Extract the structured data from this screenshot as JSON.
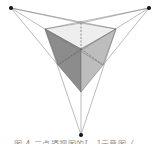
{
  "diagram": {
    "vanishing_points": [
      {
        "name": "left",
        "x": 11,
        "y": 8
      },
      {
        "name": "right",
        "x": 149,
        "y": 8
      },
      {
        "name": "bottom",
        "x": 81,
        "y": 135
      }
    ],
    "cube_vertices": {
      "top_left": [
        45,
        29
      ],
      "top_back": [
        81,
        23
      ],
      "top_right": [
        116,
        29
      ],
      "center": [
        81,
        49
      ],
      "left_mid": [
        58,
        65
      ],
      "right_mid": [
        103,
        65
      ],
      "bottom": [
        81,
        92
      ]
    },
    "colors": {
      "top_face": "#eeeeee",
      "left_face": "#8c8c8c",
      "right_face": "#bdbdbd",
      "lines": "#777777",
      "points": "#111111"
    }
  },
  "caption": {
    "text": "图 4  三点透视图的[…]示意图（…"
  }
}
